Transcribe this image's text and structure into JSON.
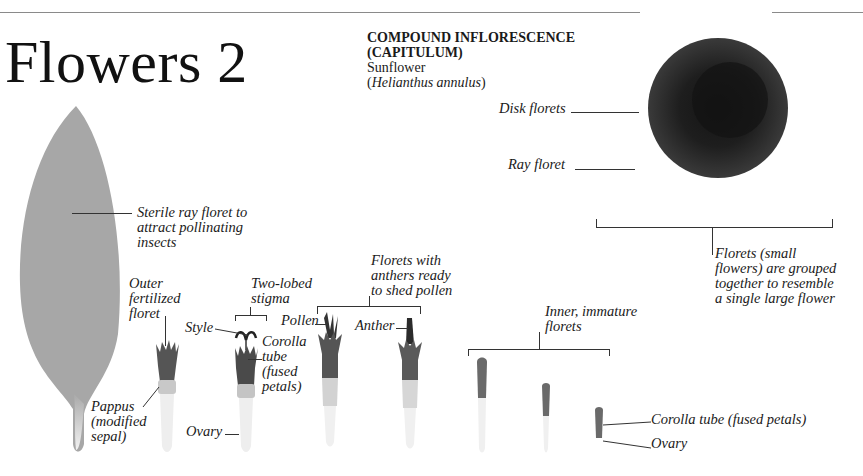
{
  "page": {
    "title": "Flowers 2"
  },
  "header": {
    "heading_line1": "COMPOUND INFLORESCENCE",
    "heading_line2": "(CAPITULUM)",
    "common_name": "Sunflower",
    "scientific_name_open": "(",
    "scientific_name": "Helianthus annulus",
    "scientific_name_close": ")"
  },
  "sunflower_labels": {
    "disk_florets": "Disk florets",
    "ray_floret": "Ray floret",
    "florets_grouped": [
      "Florets (small",
      "flowers) are grouped",
      "together to resemble",
      "a single large flower"
    ]
  },
  "ray_petal_labels": {
    "sterile_ray_floret": [
      "Sterile ray floret to",
      "attract pollinating",
      "insects"
    ]
  },
  "floret_labels": {
    "outer_fertilized": [
      "Outer",
      "fertilized",
      "floret"
    ],
    "pappus": [
      "Pappus",
      "(modified",
      "sepal)"
    ],
    "two_lobed_stigma": [
      "Two-lobed",
      "stigma"
    ],
    "style": "Style",
    "corolla_tube_short": [
      "Corolla",
      "tube",
      "(fused",
      "petals)"
    ],
    "ovary_1": "Ovary",
    "florets_with_anthers": [
      "Florets with",
      "anthers ready",
      "to shed pollen"
    ],
    "pollen": "Pollen",
    "anther": "Anther",
    "inner_immature": [
      "Inner, immature",
      "florets"
    ],
    "corolla_tube_long": "Corolla tube (fused petals)",
    "ovary_2": "Ovary"
  },
  "colors": {
    "petal": "#a8a8a8",
    "disk_outer": "#2e2e2e",
    "disk_inner": "#1a1a1a",
    "rule": "#8a8a8a",
    "text": "#1a1a1a"
  }
}
